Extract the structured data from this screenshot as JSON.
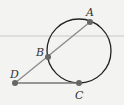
{
  "diagram": {
    "type": "geometry",
    "circle": {
      "cx": 79,
      "cy": 51,
      "r": 32
    },
    "points": [
      {
        "id": "A",
        "label": "A",
        "x": 90,
        "y": 22,
        "lx": 87,
        "ly": 16
      },
      {
        "id": "B",
        "label": "B",
        "x": 48,
        "y": 57,
        "lx": 36,
        "ly": 55
      },
      {
        "id": "C",
        "label": "C",
        "x": 79,
        "y": 83,
        "lx": 75,
        "ly": 98
      },
      {
        "id": "D",
        "label": "D",
        "x": 15,
        "y": 83,
        "lx": 10,
        "ly": 78
      }
    ],
    "segments": [
      {
        "from": "D",
        "to": "A",
        "name": "secant-DA"
      },
      {
        "from": "D",
        "to": "C",
        "name": "tangent-DC"
      }
    ],
    "colors": {
      "background": "#f3f3f1",
      "circle": "#222222",
      "secant": "#8a8a8a",
      "tangent": "#777777",
      "point": "#666666",
      "rule": "#c8c8c8"
    }
  }
}
